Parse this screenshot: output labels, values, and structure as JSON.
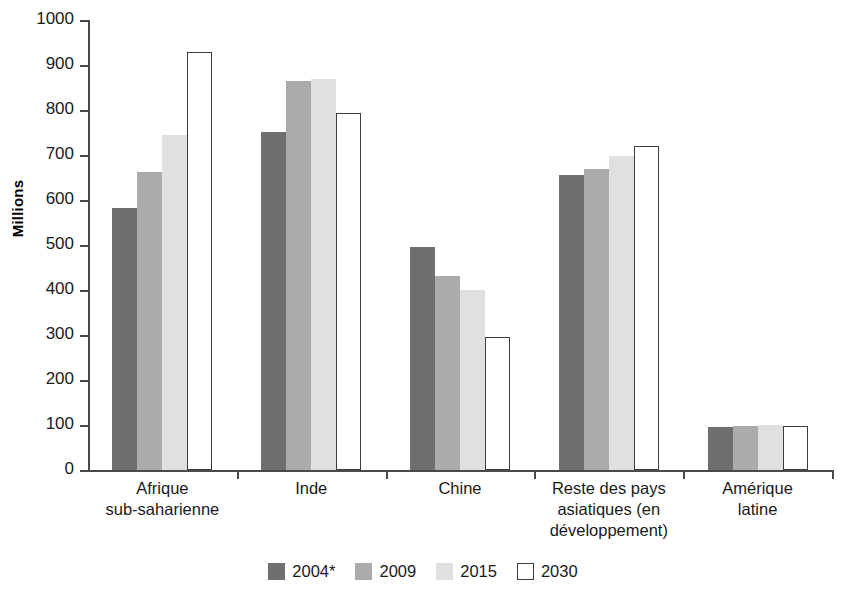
{
  "chart_data": {
    "type": "bar",
    "title": "",
    "subtitle": "",
    "xlabel": "",
    "ylabel": "Millions",
    "ylim": [
      0,
      1000
    ],
    "ytick_step": 100,
    "ytick_labels": [
      "1000",
      "900",
      "800",
      "700",
      "600",
      "500",
      "400",
      "300",
      "200",
      "100",
      "0"
    ],
    "ytick_values": [
      1000,
      900,
      800,
      700,
      600,
      500,
      400,
      300,
      200,
      100,
      0
    ],
    "grid": false,
    "legend_position": "bottom",
    "categories": [
      "Afrique sub-saharienne",
      "Inde",
      "Chine",
      "Reste des pays asiatiques (en développement)",
      "Amérique latine"
    ],
    "category_lines": [
      [
        "Afrique",
        "sub-saharienne"
      ],
      [
        "Inde"
      ],
      [
        "Chine"
      ],
      [
        "Reste des pays",
        "asiatiques (en",
        "développement)"
      ],
      [
        "Amérique",
        "latine"
      ]
    ],
    "series": [
      {
        "name": "2004*",
        "color": "#6f6f6f",
        "values": [
          583,
          752,
          495,
          655,
          95
        ]
      },
      {
        "name": "2009",
        "color": "#ababab",
        "values": [
          663,
          865,
          432,
          668,
          98
        ]
      },
      {
        "name": "2015",
        "color": "#e0e0e0",
        "values": [
          745,
          870,
          400,
          697,
          100
        ]
      },
      {
        "name": "2030",
        "color": "#ffffff",
        "values": [
          930,
          794,
          296,
          720,
          98
        ]
      }
    ]
  },
  "legend": {
    "items": [
      {
        "label": "2004*",
        "swatch": "s0"
      },
      {
        "label": "2009",
        "swatch": "s1"
      },
      {
        "label": "2015",
        "swatch": "s2"
      },
      {
        "label": "2030",
        "swatch": "s3"
      }
    ]
  }
}
